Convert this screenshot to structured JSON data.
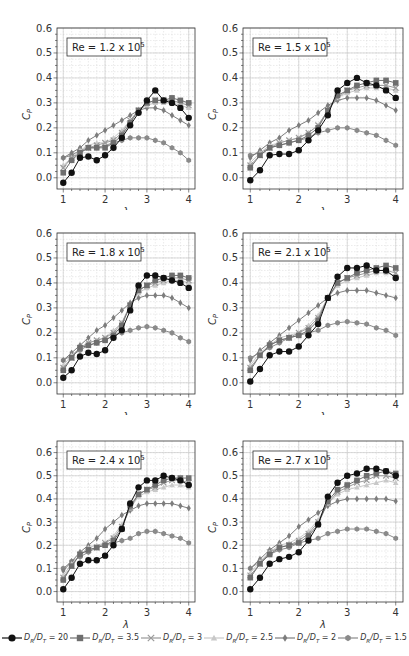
{
  "figure": {
    "x_axis_label": "λ",
    "y_axis_label": "C",
    "y_axis_label_sub": "P"
  },
  "legend": [
    {
      "label_prefix": "D",
      "sub1": "R",
      "mid": "/D",
      "sub2": "T",
      "value": " = 20",
      "color": "#111111",
      "marker": "circle"
    },
    {
      "label_prefix": "D",
      "sub1": "R",
      "mid": "/D",
      "sub2": "T",
      "value": " = 3.5",
      "color": "#6e6e6e",
      "marker": "square"
    },
    {
      "label_prefix": "D",
      "sub1": "R",
      "mid": "/D",
      "sub2": "T",
      "value": " = 3",
      "color": "#9a9a9a",
      "marker": "x"
    },
    {
      "label_prefix": "D",
      "sub1": "R",
      "mid": "/D",
      "sub2": "T",
      "value": " = 2.5",
      "color": "#c8c8c8",
      "marker": "triangle"
    },
    {
      "label_prefix": "D",
      "sub1": "R",
      "mid": "/D",
      "sub2": "T",
      "value": " = 2",
      "color": "#7d7d7d",
      "marker": "diamond"
    },
    {
      "label_prefix": "D",
      "sub1": "R",
      "mid": "/D",
      "sub2": "T",
      "value": " = 1.5",
      "color": "#8a8a8a",
      "marker": "hexagon"
    }
  ],
  "chart_data": [
    {
      "type": "line",
      "annotation": "Re = 1.2 x 10^5",
      "annotation_base": "Re = 1.2 x 10",
      "annotation_exp": "5",
      "xlabel": "λ",
      "ylabel": "C_P",
      "xlim": [
        0.85,
        4.15
      ],
      "ylim": [
        -0.045,
        0.6
      ],
      "xticks": [
        1,
        2,
        3,
        4
      ],
      "yticks": [
        0.0,
        0.1,
        0.2,
        0.3,
        0.4,
        0.5,
        0.6
      ],
      "grid": true,
      "x": [
        1.0,
        1.2,
        1.4,
        1.6,
        1.8,
        2.0,
        2.2,
        2.4,
        2.6,
        2.8,
        3.0,
        3.2,
        3.4,
        3.6,
        3.8,
        4.0
      ],
      "series": [
        {
          "name": "DR/DT = 20",
          "values": [
            -0.02,
            0.02,
            0.08,
            0.085,
            0.07,
            0.09,
            0.12,
            0.16,
            0.21,
            0.26,
            0.31,
            0.35,
            0.31,
            0.3,
            0.28,
            0.24
          ]
        },
        {
          "name": "DR/DT = 3.5",
          "values": [
            0.02,
            0.07,
            0.1,
            0.12,
            0.12,
            0.12,
            0.14,
            0.17,
            0.22,
            0.27,
            0.3,
            0.31,
            0.31,
            0.32,
            0.31,
            0.3
          ]
        },
        {
          "name": "DR/DT = 3",
          "values": [
            0.04,
            0.08,
            0.1,
            0.12,
            0.13,
            0.14,
            0.15,
            0.18,
            0.23,
            0.27,
            0.3,
            0.31,
            0.31,
            0.31,
            0.3,
            0.29
          ]
        },
        {
          "name": "DR/DT = 2.5",
          "values": [
            0.05,
            0.08,
            0.11,
            0.13,
            0.14,
            0.14,
            0.16,
            0.19,
            0.23,
            0.27,
            0.29,
            0.3,
            0.3,
            0.3,
            0.29,
            0.28
          ]
        },
        {
          "name": "DR/DT = 2",
          "values": [
            0.08,
            0.1,
            0.12,
            0.15,
            0.17,
            0.19,
            0.21,
            0.23,
            0.25,
            0.27,
            0.28,
            0.28,
            0.27,
            0.25,
            0.23,
            0.21
          ]
        },
        {
          "name": "DR/DT = 1.5",
          "values": [
            0.08,
            0.09,
            0.11,
            0.12,
            0.12,
            0.13,
            0.14,
            0.15,
            0.16,
            0.16,
            0.16,
            0.15,
            0.14,
            0.12,
            0.1,
            0.07
          ]
        }
      ]
    },
    {
      "type": "line",
      "annotation": "Re = 1.5 x 10^5",
      "annotation_base": "Re = 1.5 x 10",
      "annotation_exp": "5",
      "xlabel": "λ",
      "ylabel": "C_P",
      "xlim": [
        0.85,
        4.15
      ],
      "ylim": [
        -0.045,
        0.6
      ],
      "xticks": [
        1,
        2,
        3,
        4
      ],
      "yticks": [
        0.0,
        0.1,
        0.2,
        0.3,
        0.4,
        0.5,
        0.6
      ],
      "grid": true,
      "x": [
        1.0,
        1.2,
        1.4,
        1.6,
        1.8,
        2.0,
        2.2,
        2.4,
        2.6,
        2.8,
        3.0,
        3.2,
        3.4,
        3.6,
        3.8,
        4.0
      ],
      "series": [
        {
          "name": "DR/DT = 20",
          "values": [
            -0.01,
            0.03,
            0.09,
            0.095,
            0.095,
            0.11,
            0.15,
            0.19,
            0.25,
            0.35,
            0.38,
            0.4,
            0.38,
            0.37,
            0.35,
            0.32
          ]
        },
        {
          "name": "DR/DT = 3.5",
          "values": [
            0.04,
            0.09,
            0.12,
            0.13,
            0.14,
            0.15,
            0.17,
            0.2,
            0.27,
            0.33,
            0.35,
            0.37,
            0.38,
            0.39,
            0.39,
            0.38
          ]
        },
        {
          "name": "DR/DT = 3",
          "values": [
            0.05,
            0.09,
            0.12,
            0.14,
            0.15,
            0.16,
            0.18,
            0.21,
            0.27,
            0.32,
            0.35,
            0.36,
            0.37,
            0.37,
            0.37,
            0.36
          ]
        },
        {
          "name": "DR/DT = 2.5",
          "values": [
            0.06,
            0.1,
            0.13,
            0.14,
            0.15,
            0.16,
            0.18,
            0.21,
            0.27,
            0.32,
            0.34,
            0.35,
            0.36,
            0.36,
            0.36,
            0.35
          ]
        },
        {
          "name": "DR/DT = 2",
          "values": [
            0.08,
            0.11,
            0.14,
            0.16,
            0.19,
            0.21,
            0.23,
            0.26,
            0.29,
            0.31,
            0.32,
            0.32,
            0.32,
            0.31,
            0.29,
            0.27
          ]
        },
        {
          "name": "DR/DT = 1.5",
          "values": [
            0.09,
            0.1,
            0.12,
            0.13,
            0.14,
            0.15,
            0.16,
            0.18,
            0.19,
            0.2,
            0.2,
            0.19,
            0.18,
            0.17,
            0.15,
            0.13
          ]
        }
      ]
    },
    {
      "type": "line",
      "annotation": "Re = 1.8 x 10^5",
      "annotation_base": "Re = 1.8 x 10",
      "annotation_exp": "5",
      "xlabel": "λ",
      "ylabel": "C_P",
      "xlim": [
        0.85,
        4.15
      ],
      "ylim": [
        -0.045,
        0.6
      ],
      "xticks": [
        1,
        2,
        3,
        4
      ],
      "yticks": [
        0.0,
        0.1,
        0.2,
        0.3,
        0.4,
        0.5,
        0.6
      ],
      "grid": true,
      "x": [
        1.0,
        1.2,
        1.4,
        1.6,
        1.8,
        2.0,
        2.2,
        2.4,
        2.6,
        2.8,
        3.0,
        3.2,
        3.4,
        3.6,
        3.8,
        4.0
      ],
      "series": [
        {
          "name": "DR/DT = 20",
          "values": [
            0.02,
            0.05,
            0.105,
            0.12,
            0.115,
            0.13,
            0.18,
            0.21,
            0.29,
            0.39,
            0.43,
            0.43,
            0.42,
            0.41,
            0.4,
            0.38
          ]
        },
        {
          "name": "DR/DT = 3.5",
          "values": [
            0.05,
            0.1,
            0.14,
            0.15,
            0.16,
            0.17,
            0.19,
            0.23,
            0.31,
            0.37,
            0.39,
            0.41,
            0.42,
            0.43,
            0.43,
            0.42
          ]
        },
        {
          "name": "DR/DT = 3",
          "values": [
            0.06,
            0.1,
            0.14,
            0.16,
            0.17,
            0.18,
            0.2,
            0.24,
            0.31,
            0.37,
            0.39,
            0.4,
            0.41,
            0.42,
            0.42,
            0.41
          ]
        },
        {
          "name": "DR/DT = 2.5",
          "values": [
            0.07,
            0.11,
            0.14,
            0.16,
            0.17,
            0.18,
            0.21,
            0.24,
            0.31,
            0.36,
            0.38,
            0.39,
            0.4,
            0.41,
            0.41,
            0.4
          ]
        },
        {
          "name": "DR/DT = 2",
          "values": [
            0.09,
            0.12,
            0.15,
            0.18,
            0.21,
            0.23,
            0.26,
            0.29,
            0.32,
            0.34,
            0.35,
            0.35,
            0.35,
            0.34,
            0.32,
            0.3
          ]
        },
        {
          "name": "DR/DT = 1.5",
          "values": [
            0.09,
            0.11,
            0.13,
            0.15,
            0.16,
            0.17,
            0.19,
            0.2,
            0.21,
            0.22,
            0.225,
            0.22,
            0.21,
            0.2,
            0.18,
            0.165
          ]
        }
      ]
    },
    {
      "type": "line",
      "annotation": "Re = 2.1 x 10^5",
      "annotation_base": "Re = 2.1 x 10",
      "annotation_exp": "5",
      "xlabel": "λ",
      "ylabel": "C_P",
      "xlim": [
        0.85,
        4.15
      ],
      "ylim": [
        -0.045,
        0.6
      ],
      "xticks": [
        1,
        2,
        3,
        4
      ],
      "yticks": [
        0.0,
        0.1,
        0.2,
        0.3,
        0.4,
        0.5,
        0.6
      ],
      "grid": true,
      "x": [
        1.0,
        1.2,
        1.4,
        1.6,
        1.8,
        2.0,
        2.2,
        2.4,
        2.6,
        2.8,
        3.0,
        3.2,
        3.4,
        3.6,
        3.8,
        4.0
      ],
      "series": [
        {
          "name": "DR/DT = 20",
          "values": [
            0.005,
            0.055,
            0.11,
            0.125,
            0.125,
            0.145,
            0.19,
            0.235,
            0.34,
            0.425,
            0.46,
            0.46,
            0.47,
            0.45,
            0.45,
            0.42
          ]
        },
        {
          "name": "DR/DT = 3.5",
          "values": [
            0.05,
            0.11,
            0.15,
            0.17,
            0.18,
            0.19,
            0.21,
            0.25,
            0.34,
            0.4,
            0.42,
            0.44,
            0.45,
            0.46,
            0.47,
            0.46
          ]
        },
        {
          "name": "DR/DT = 3",
          "values": [
            0.06,
            0.11,
            0.15,
            0.17,
            0.18,
            0.2,
            0.22,
            0.26,
            0.34,
            0.4,
            0.42,
            0.43,
            0.44,
            0.45,
            0.45,
            0.44
          ]
        },
        {
          "name": "DR/DT = 2.5",
          "values": [
            0.07,
            0.12,
            0.15,
            0.18,
            0.19,
            0.2,
            0.23,
            0.27,
            0.34,
            0.39,
            0.41,
            0.42,
            0.43,
            0.44,
            0.44,
            0.43
          ]
        },
        {
          "name": "DR/DT = 2",
          "values": [
            0.09,
            0.13,
            0.16,
            0.19,
            0.22,
            0.25,
            0.28,
            0.31,
            0.34,
            0.36,
            0.37,
            0.37,
            0.37,
            0.36,
            0.35,
            0.34
          ]
        },
        {
          "name": "DR/DT = 1.5",
          "values": [
            0.1,
            0.12,
            0.14,
            0.16,
            0.18,
            0.19,
            0.2,
            0.21,
            0.23,
            0.24,
            0.245,
            0.24,
            0.235,
            0.22,
            0.21,
            0.19
          ]
        }
      ]
    },
    {
      "type": "line",
      "annotation": "Re = 2.4 x 10^5",
      "annotation_base": "Re = 2.4 x 10",
      "annotation_exp": "5",
      "xlabel": "λ",
      "ylabel": "C_P",
      "xlim": [
        0.85,
        4.15
      ],
      "ylim": [
        -0.045,
        0.65
      ],
      "xticks": [
        1,
        2,
        3,
        4
      ],
      "yticks": [
        0.0,
        0.1,
        0.2,
        0.3,
        0.4,
        0.5,
        0.6
      ],
      "grid": true,
      "x": [
        1.0,
        1.2,
        1.4,
        1.6,
        1.8,
        2.0,
        2.2,
        2.4,
        2.6,
        2.8,
        3.0,
        3.2,
        3.4,
        3.6,
        3.8,
        4.0
      ],
      "series": [
        {
          "name": "DR/DT = 20",
          "values": [
            0.01,
            0.06,
            0.12,
            0.135,
            0.135,
            0.155,
            0.2,
            0.27,
            0.38,
            0.45,
            0.48,
            0.48,
            0.5,
            0.49,
            0.48,
            0.46
          ]
        },
        {
          "name": "DR/DT = 3.5",
          "values": [
            0.05,
            0.11,
            0.16,
            0.18,
            0.19,
            0.2,
            0.22,
            0.27,
            0.37,
            0.42,
            0.44,
            0.46,
            0.48,
            0.49,
            0.49,
            0.49
          ]
        },
        {
          "name": "DR/DT = 3",
          "values": [
            0.06,
            0.11,
            0.16,
            0.18,
            0.19,
            0.21,
            0.23,
            0.28,
            0.36,
            0.42,
            0.44,
            0.45,
            0.47,
            0.48,
            0.48,
            0.47
          ]
        },
        {
          "name": "DR/DT = 2.5",
          "values": [
            0.07,
            0.12,
            0.16,
            0.19,
            0.2,
            0.21,
            0.24,
            0.29,
            0.36,
            0.41,
            0.43,
            0.44,
            0.45,
            0.46,
            0.46,
            0.45
          ]
        },
        {
          "name": "DR/DT = 2",
          "values": [
            0.09,
            0.13,
            0.17,
            0.2,
            0.23,
            0.27,
            0.3,
            0.33,
            0.35,
            0.37,
            0.38,
            0.38,
            0.38,
            0.38,
            0.37,
            0.36
          ]
        },
        {
          "name": "DR/DT = 1.5",
          "values": [
            0.1,
            0.13,
            0.15,
            0.17,
            0.19,
            0.2,
            0.21,
            0.22,
            0.23,
            0.25,
            0.26,
            0.26,
            0.25,
            0.24,
            0.23,
            0.21
          ]
        }
      ]
    },
    {
      "type": "line",
      "annotation": "Re = 2.7 x 10^5",
      "annotation_base": "Re = 2.7 x 10",
      "annotation_exp": "5",
      "xlabel": "λ",
      "ylabel": "C_P",
      "xlim": [
        0.85,
        4.15
      ],
      "ylim": [
        -0.045,
        0.65
      ],
      "xticks": [
        1,
        2,
        3,
        4
      ],
      "yticks": [
        0.0,
        0.1,
        0.2,
        0.3,
        0.4,
        0.5,
        0.6
      ],
      "grid": true,
      "x": [
        1.0,
        1.2,
        1.4,
        1.6,
        1.8,
        2.0,
        2.2,
        2.4,
        2.6,
        2.8,
        3.0,
        3.2,
        3.4,
        3.6,
        3.8,
        4.0
      ],
      "series": [
        {
          "name": "DR/DT = 20",
          "values": [
            0.01,
            0.06,
            0.12,
            0.14,
            0.15,
            0.17,
            0.22,
            0.29,
            0.41,
            0.47,
            0.5,
            0.51,
            0.53,
            0.53,
            0.52,
            0.5
          ]
        },
        {
          "name": "DR/DT = 3.5",
          "values": [
            0.06,
            0.12,
            0.16,
            0.19,
            0.2,
            0.21,
            0.24,
            0.29,
            0.39,
            0.44,
            0.46,
            0.48,
            0.5,
            0.51,
            0.52,
            0.51
          ]
        },
        {
          "name": "DR/DT = 3",
          "values": [
            0.07,
            0.12,
            0.17,
            0.19,
            0.2,
            0.22,
            0.25,
            0.3,
            0.38,
            0.43,
            0.45,
            0.47,
            0.48,
            0.5,
            0.5,
            0.49
          ]
        },
        {
          "name": "DR/DT = 2.5",
          "values": [
            0.08,
            0.13,
            0.17,
            0.2,
            0.21,
            0.23,
            0.26,
            0.31,
            0.38,
            0.42,
            0.44,
            0.45,
            0.46,
            0.47,
            0.48,
            0.47
          ]
        },
        {
          "name": "DR/DT = 2",
          "values": [
            0.1,
            0.14,
            0.18,
            0.21,
            0.24,
            0.28,
            0.31,
            0.34,
            0.37,
            0.39,
            0.4,
            0.4,
            0.4,
            0.4,
            0.4,
            0.39
          ]
        },
        {
          "name": "DR/DT = 1.5",
          "values": [
            0.1,
            0.13,
            0.16,
            0.18,
            0.19,
            0.21,
            0.22,
            0.23,
            0.25,
            0.26,
            0.27,
            0.27,
            0.27,
            0.26,
            0.25,
            0.23
          ]
        }
      ]
    }
  ]
}
